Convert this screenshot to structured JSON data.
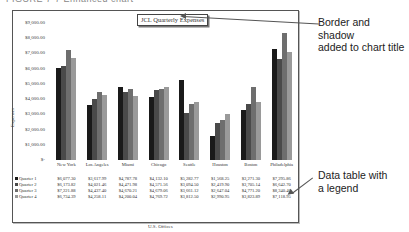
{
  "figure": {
    "caption_top": "FIGURE 7-7  Enhanced chart",
    "callouts": [
      {
        "text_line1": "Border and shadow",
        "text_line2": "added to chart title"
      },
      {
        "text_line1": "Data table with",
        "text_line2": "a legend"
      }
    ]
  },
  "chart_data": {
    "type": "bar",
    "title": "JCL Quarterly Expenses",
    "xlabel": "U.S. Offices",
    "ylabel": "Expenses",
    "ylim": [
      0,
      9000
    ],
    "yticks": [
      "$-",
      "$1,000.00",
      "$2,000.00",
      "$3,000.00",
      "$4,000.00",
      "$5,000.00",
      "$6,000.00",
      "$7,000.00",
      "$8,000.00",
      "$9,000.00"
    ],
    "grid": false,
    "legend_position": "data table",
    "categories": [
      "New York",
      "Los Angeles",
      "Miami",
      "Chicago",
      "Seattle",
      "Houston",
      "Boston",
      "Philadelphia"
    ],
    "series": [
      {
        "name": "Quarter 1",
        "color": "#1a1a1a",
        "values": [
          6077.3,
          3617.99,
          4787.78,
          4132.1,
          5282.77,
          1568.25,
          3271.3,
          7295.86
        ],
        "labels": [
          "$6,077.30",
          "$3,617.99",
          "$4,787.78",
          "$4,132.10",
          "$5,282.77",
          "$1,568.25",
          "$3,271.30",
          "$7,295.86"
        ]
      },
      {
        "name": "Quarter 2",
        "color": "#4a4a4a",
        "values": [
          6173.82,
          4021.46,
          4471.98,
          4571.56,
          3094.5,
          2419.9,
          3705.14,
          6642.7
        ],
        "labels": [
          "$6,173.82",
          "$4,021.46",
          "$4,471.98",
          "$4,571.56",
          "$3,094.50",
          "$2,419.90",
          "$3,705.14",
          "$6,642.70"
        ]
      },
      {
        "name": "Quarter 3",
        "color": "#6e6e6e",
        "values": [
          7221.88,
          4437.4,
          4670.21,
          4679.06,
          3661.12,
          2647.04,
          4771.2,
          8340.46
        ],
        "labels": [
          "$7,221.88",
          "$4,437.40",
          "$4,670.21",
          "$4,679.06",
          "$3,661.12",
          "$2,647.04",
          "$4,771.20",
          "$8,340.46"
        ]
      },
      {
        "name": "Quarter 4",
        "color": "#9a9a9a",
        "values": [
          6734.39,
          4258.11,
          4200.04,
          4769.72,
          3812.5,
          2990.95,
          3823.89,
          7118.95
        ],
        "labels": [
          "$6,734.39",
          "$4,258.11",
          "$4,200.04",
          "$4,769.72",
          "$3,812.50",
          "$2,990.95",
          "$3,823.89",
          "$7,118.95"
        ]
      }
    ]
  }
}
